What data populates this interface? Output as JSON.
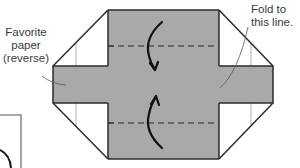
{
  "diagram": {
    "type": "origami-fold-step",
    "colors": {
      "paper_fill": "#a9a9a9",
      "outline": "#2b2b2b",
      "background": "#ffffff",
      "guide_line": "#9a9a9a"
    },
    "labels": {
      "favorite_paper": {
        "lines": [
          "Favorite",
          "paper",
          "(reverse)"
        ]
      },
      "fold_line": {
        "lines": [
          "Fold to",
          "this line."
        ]
      }
    },
    "arrows": [
      {
        "name": "fold-down-arrow",
        "direction": "down"
      },
      {
        "name": "fold-up-arrow",
        "direction": "up"
      }
    ],
    "fold_lines": [
      {
        "name": "upper-valley-fold",
        "style": "dashed"
      },
      {
        "name": "lower-valley-fold",
        "style": "dashed"
      }
    ]
  }
}
